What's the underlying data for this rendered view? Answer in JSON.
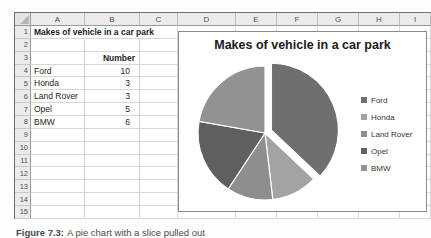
{
  "sheet": {
    "columns": [
      "A",
      "B",
      "C",
      "D",
      "E",
      "F",
      "G",
      "H",
      "I"
    ],
    "row_count": 15,
    "cells": {
      "A1": {
        "text": "Makes of vehicle in a car park",
        "bold": true,
        "span": 3
      },
      "B3": {
        "text": "Number",
        "bold": true,
        "align": "rightsm"
      },
      "A4": {
        "text": "Ford"
      },
      "B4": {
        "text": "10",
        "align": "right"
      },
      "A5": {
        "text": "Honda"
      },
      "B5": {
        "text": "3",
        "align": "right"
      },
      "A6": {
        "text": "Land Rover"
      },
      "B6": {
        "text": "3",
        "align": "right"
      },
      "A7": {
        "text": "Opel"
      },
      "B7": {
        "text": "5",
        "align": "right"
      },
      "A8": {
        "text": "BMW"
      },
      "B8": {
        "text": "6",
        "align": "right"
      }
    }
  },
  "chart": {
    "title": "Makes of vehicle in a car park",
    "legend_position": "right"
  },
  "chart_data": {
    "type": "pie",
    "title": "Makes of vehicle in a car park",
    "categories": [
      "Ford",
      "Honda",
      "Land Rover",
      "Opel",
      "BMW"
    ],
    "values": [
      10,
      3,
      3,
      5,
      6
    ],
    "total": 27,
    "colors": [
      "#6f6f6f",
      "#a3a3a3",
      "#8e8e8e",
      "#5f5f5f",
      "#929292"
    ],
    "exploded_slice": "Ford",
    "legend_position": "right",
    "start_angle_deg": 0
  },
  "caption": {
    "prefix": "Figure 7.3:",
    "text": "A pie chart with a slice pulled out"
  }
}
